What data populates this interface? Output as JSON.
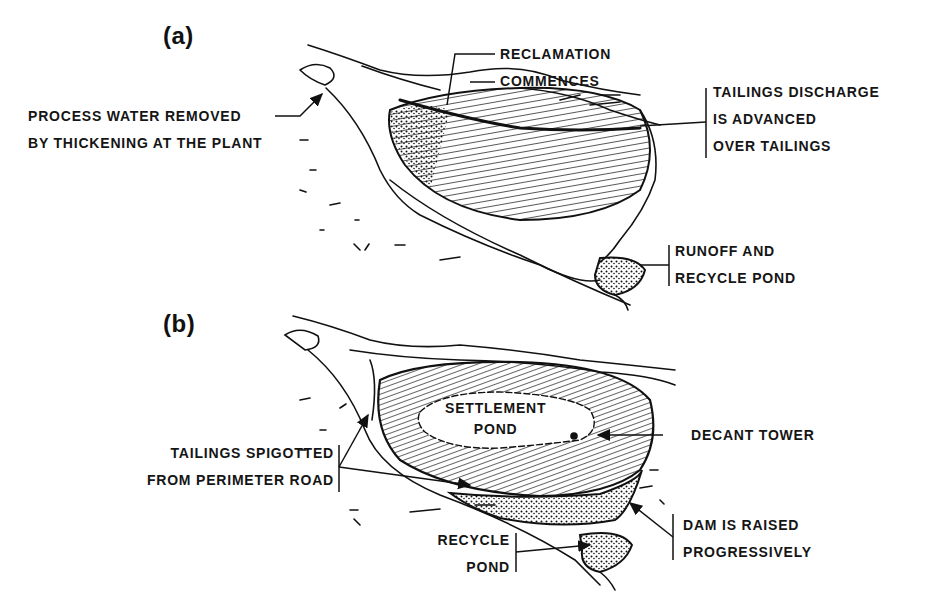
{
  "figure": {
    "panels": [
      {
        "id": "a",
        "label": "(a)",
        "annotations": {
          "process_water": [
            "PROCESS WATER REMOVED",
            "BY THICKENING AT THE PLANT"
          ],
          "reclamation": [
            "RECLAMATION",
            "COMMENCES"
          ],
          "tailings_discharge": [
            "TAILINGS DISCHARGE",
            "IS ADVANCED",
            "OVER TAILINGS"
          ],
          "runoff": [
            "RUNOFF AND",
            "RECYCLE POND"
          ]
        }
      },
      {
        "id": "b",
        "label": "(b)",
        "annotations": {
          "settlement_pond": [
            "SETTLEMENT",
            "POND"
          ],
          "decant_tower": [
            "DECANT TOWER"
          ],
          "tailings_spigotted": [
            "TAILINGS SPIGOTTED",
            "FROM PERIMETER ROAD"
          ],
          "dam_raised": [
            "DAM IS RAISED",
            "PROGRESSIVELY"
          ],
          "recycle_pond": [
            "RECYCLE",
            "POND"
          ]
        }
      }
    ],
    "colors": {
      "ink": "#111111",
      "paper": "#ffffff"
    }
  }
}
